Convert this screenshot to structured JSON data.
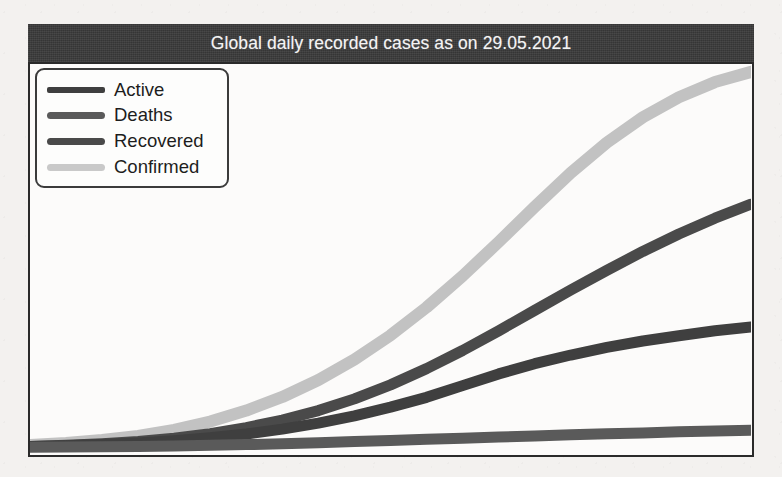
{
  "chart_data": {
    "type": "line",
    "title": "Global daily recorded cases as on 29.05.2021",
    "xlabel": "",
    "ylabel": "",
    "grid": false,
    "legend_position": "top-left",
    "x": [
      0,
      5,
      10,
      15,
      20,
      25,
      30,
      35,
      40,
      45,
      50,
      55,
      60,
      65,
      70,
      75,
      80,
      85,
      90,
      95,
      100
    ],
    "series": [
      {
        "name": "Active",
        "color": "#3f3f3f",
        "values": [
          0.4,
          0.6,
          0.9,
          1.3,
          1.9,
          2.7,
          3.7,
          5.0,
          6.6,
          8.5,
          10.8,
          13.4,
          16.5,
          19.6,
          22.3,
          24.6,
          26.6,
          28.3,
          29.7,
          31.0,
          32.0
        ]
      },
      {
        "name": "Deaths",
        "color": "#5a5a5a",
        "values": [
          0.2,
          0.25,
          0.3,
          0.4,
          0.5,
          0.7,
          0.9,
          1.1,
          1.4,
          1.7,
          2.0,
          2.3,
          2.6,
          2.9,
          3.2,
          3.5,
          3.8,
          4.0,
          4.3,
          4.5,
          4.7
        ]
      },
      {
        "name": "Recovered",
        "color": "#4a4a4a",
        "values": [
          0.4,
          0.7,
          1.1,
          1.7,
          2.6,
          3.8,
          5.4,
          7.4,
          9.9,
          13.0,
          16.7,
          21.0,
          25.8,
          31.0,
          36.4,
          41.8,
          47.0,
          52.0,
          56.6,
          60.8,
          64.5
        ]
      },
      {
        "name": "Confirmed",
        "color": "#c2c2c2",
        "values": [
          0.8,
          1.3,
          2.1,
          3.2,
          4.8,
          7.0,
          9.9,
          13.5,
          18.0,
          23.4,
          29.8,
          37.2,
          45.5,
          54.5,
          63.8,
          72.8,
          80.8,
          87.5,
          92.8,
          96.8,
          99.5
        ]
      }
    ],
    "ylim": [
      0,
      100
    ],
    "xlim": [
      0,
      100
    ]
  },
  "figure": {
    "title": "Global daily recorded cases as on 29.05.2021"
  },
  "legend": {
    "items": [
      {
        "label": "Active",
        "color": "#3f3f3f"
      },
      {
        "label": "Deaths",
        "color": "#5a5a5a"
      },
      {
        "label": "Recovered",
        "color": "#4a4a4a"
      },
      {
        "label": "Confirmed",
        "color": "#c9c9c9"
      }
    ]
  }
}
